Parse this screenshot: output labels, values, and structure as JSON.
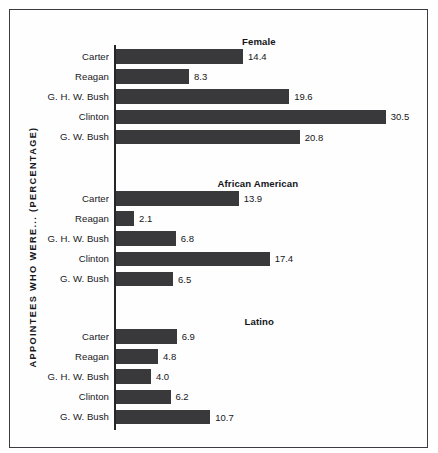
{
  "figure": {
    "y_axis_label": "APPOINTEES WHO WERE... (PERCENTAGE)",
    "bar_color": "#39393c",
    "axis_color": "#25252a",
    "frame_color": "#3b3b42",
    "background_color": "#ffffff"
  },
  "chart_data": {
    "type": "bar",
    "title": "",
    "subtitle": "",
    "orientation": "horizontal",
    "xlabel": "",
    "ylabel": "APPOINTEES WHO WERE... (PERCENTAGE)",
    "grid": false,
    "legend": "none",
    "xlim": [
      0,
      33
    ],
    "units": "percent",
    "categories": [
      "Carter",
      "Reagan",
      "G. H. W. Bush",
      "Clinton",
      "G. W. Bush"
    ],
    "panels": [
      {
        "title": "Female",
        "categories": [
          "Carter",
          "Reagan",
          "G. H. W. Bush",
          "Clinton",
          "G. W. Bush"
        ],
        "values": [
          14.4,
          8.3,
          19.6,
          30.5,
          20.8
        ],
        "labels": [
          "14.4",
          "8.3",
          "19.6",
          "30.5",
          "20.8"
        ]
      },
      {
        "title": "African American",
        "categories": [
          "Carter",
          "Reagan",
          "G. H. W. Bush",
          "Clinton",
          "G. W. Bush"
        ],
        "values": [
          13.9,
          2.1,
          6.8,
          17.4,
          6.5
        ],
        "labels": [
          "13.9",
          "2.1",
          "6.8",
          "17.4",
          "6.5"
        ]
      },
      {
        "title": "Latino",
        "categories": [
          "Carter",
          "Reagan",
          "G. H. W. Bush",
          "Clinton",
          "G. W. Bush"
        ],
        "values": [
          6.9,
          4.8,
          4.0,
          6.2,
          10.7
        ],
        "labels": [
          "6.9",
          "4.8",
          "4.0",
          "6.2",
          "10.7"
        ]
      }
    ],
    "series": [
      {
        "name": "Female",
        "values": [
          14.4,
          8.3,
          19.6,
          30.5,
          20.8
        ]
      },
      {
        "name": "African American",
        "values": [
          13.9,
          2.1,
          6.8,
          17.4,
          6.5
        ]
      },
      {
        "name": "Latino",
        "values": [
          6.9,
          4.8,
          4.0,
          6.2,
          10.7
        ]
      }
    ]
  },
  "layout": {
    "px_per_unit": 8.86,
    "panel_tops": [
      12,
      154,
      292
    ],
    "title_tops": [
      0,
      142,
      280
    ],
    "title_centers": [
      145,
      144,
      145
    ]
  }
}
